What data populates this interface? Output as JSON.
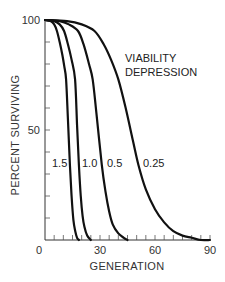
{
  "chart_data": {
    "type": "line",
    "title": "",
    "xlabel": "GENERATION",
    "ylabel": "PERCENT SURVIVING",
    "xlim": [
      0,
      90
    ],
    "ylim": [
      0,
      100
    ],
    "x_ticks": [
      0,
      30,
      60,
      90
    ],
    "x_tick_labels": [
      "0",
      "30",
      "60",
      "90"
    ],
    "x_minor_tick_step": 5,
    "y_ticks": [
      50,
      100
    ],
    "y_tick_labels": [
      "50",
      "100"
    ],
    "y_minor_tick_step": 10,
    "grid": false,
    "legend": null,
    "annotations": [
      {
        "text": "VIABILITY",
        "x": 57,
        "y": 77
      },
      {
        "text": "DEPRESSION",
        "x": 57,
        "y": 69
      },
      {
        "text": "1.5",
        "x": 5,
        "y": 35
      },
      {
        "text": "1.0",
        "x": 21,
        "y": 35
      },
      {
        "text": "0.5",
        "x": 35,
        "y": 35
      },
      {
        "text": "0.25",
        "x": 54,
        "y": 35
      }
    ],
    "series": [
      {
        "name": "1.5",
        "x": [
          0,
          3,
          5,
          6.5,
          8,
          9.5,
          10.5,
          11.5,
          12.5,
          13.6,
          14.5,
          15.5,
          16.5,
          17.5,
          18.5
        ],
        "y": [
          100,
          99.5,
          98,
          95,
          90,
          84,
          79,
          73,
          55,
          34,
          20,
          9,
          4,
          1,
          0
        ]
      },
      {
        "name": "1.0",
        "x": [
          0,
          5,
          8,
          10.4,
          12.5,
          14.5,
          16.4,
          17.5,
          18.5,
          19.5,
          20.5,
          21.5,
          23,
          25
        ],
        "y": [
          100,
          99.5,
          98,
          95,
          89,
          82,
          73,
          52,
          34,
          20,
          11,
          6,
          2,
          0
        ]
      },
      {
        "name": "0.5",
        "x": [
          0,
          8,
          13,
          18,
          21,
          24,
          26,
          28,
          31,
          33,
          35,
          37,
          40,
          43,
          45
        ],
        "y": [
          100,
          99.5,
          98,
          95,
          89,
          80,
          73,
          58,
          34,
          22,
          13,
          7,
          3,
          1,
          0
        ]
      },
      {
        "name": "0.25",
        "x": [
          0,
          12,
          20,
          27,
          32,
          36,
          40,
          44,
          48,
          51,
          55,
          60,
          65,
          70,
          75,
          80,
          85,
          90
        ],
        "y": [
          100,
          99.5,
          98,
          95,
          89,
          82,
          73,
          60,
          45,
          34,
          23,
          14,
          8,
          4,
          2,
          1,
          0,
          0
        ]
      }
    ]
  },
  "labels": {
    "y_title": "PERCENT SURVIVING",
    "x_title": "GENERATION",
    "annotation_line1": "VIABILITY",
    "annotation_line2": "DEPRESSION",
    "curve_labels": [
      "1.5",
      "1.0",
      "0.5",
      "0.25"
    ],
    "x_ticks": [
      "0",
      "30",
      "60",
      "90"
    ],
    "y_ticks": [
      "50",
      "100"
    ]
  }
}
